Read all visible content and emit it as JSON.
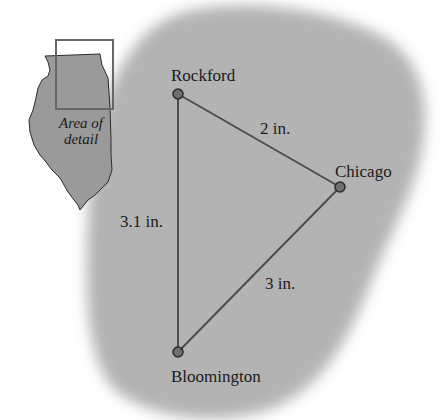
{
  "inset": {
    "state": "Illinois",
    "label_line1": "Area of",
    "label_line2": "detail"
  },
  "cities": [
    {
      "name": "Rockford",
      "x": 178,
      "y": 94
    },
    {
      "name": "Chicago",
      "x": 340,
      "y": 187
    },
    {
      "name": "Bloomington",
      "x": 178,
      "y": 352
    }
  ],
  "distances": [
    {
      "from": "Rockford",
      "to": "Chicago",
      "label": "2 in."
    },
    {
      "from": "Rockford",
      "to": "Bloomington",
      "label": "3.1 in."
    },
    {
      "from": "Chicago",
      "to": "Bloomington",
      "label": "3 in."
    }
  ],
  "colors": {
    "region_fill": "#b3b3b3",
    "state_fill": "#9a9a9a",
    "line": "#4d4d4d",
    "dot_fill": "#6e6e6e",
    "dot_stroke": "#2b2b2b",
    "text": "#1a1a1a"
  }
}
